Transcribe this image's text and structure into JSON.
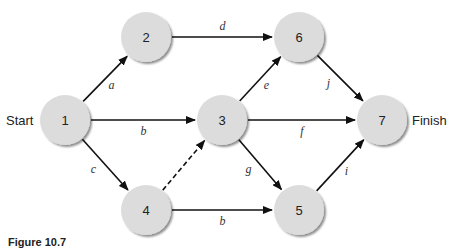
{
  "diagram": {
    "colors": {
      "node_fill": "#dcdcdc",
      "node_shadow": "#9a9a9a",
      "edge": "#111111",
      "text": "#222222"
    },
    "start_label": "Start",
    "finish_label": "Finish",
    "nodes": [
      {
        "id": "1",
        "label": "1",
        "x": 65,
        "y": 120
      },
      {
        "id": "2",
        "label": "2",
        "x": 146,
        "y": 37
      },
      {
        "id": "3",
        "label": "3",
        "x": 222,
        "y": 120
      },
      {
        "id": "4",
        "label": "4",
        "x": 146,
        "y": 210
      },
      {
        "id": "5",
        "label": "5",
        "x": 299,
        "y": 210
      },
      {
        "id": "6",
        "label": "6",
        "x": 299,
        "y": 37
      },
      {
        "id": "7",
        "label": "7",
        "x": 382,
        "y": 120
      }
    ],
    "edges": [
      {
        "from": "1",
        "to": "2",
        "label": "a",
        "style": "solid"
      },
      {
        "from": "1",
        "to": "3",
        "label": "b",
        "style": "solid"
      },
      {
        "from": "1",
        "to": "4",
        "label": "c",
        "style": "solid"
      },
      {
        "from": "2",
        "to": "6",
        "label": "d",
        "style": "solid"
      },
      {
        "from": "3",
        "to": "6",
        "label": "e",
        "style": "solid"
      },
      {
        "from": "3",
        "to": "7",
        "label": "f",
        "style": "solid"
      },
      {
        "from": "3",
        "to": "5",
        "label": "g",
        "style": "solid"
      },
      {
        "from": "4",
        "to": "3",
        "label": "",
        "style": "dashed"
      },
      {
        "from": "4",
        "to": "5",
        "label": "b",
        "style": "solid"
      },
      {
        "from": "5",
        "to": "7",
        "label": "i",
        "style": "solid"
      },
      {
        "from": "6",
        "to": "7",
        "label": "j",
        "style": "solid"
      }
    ]
  },
  "caption": {
    "figure_number": "Figure 10.7",
    "text": ""
  }
}
